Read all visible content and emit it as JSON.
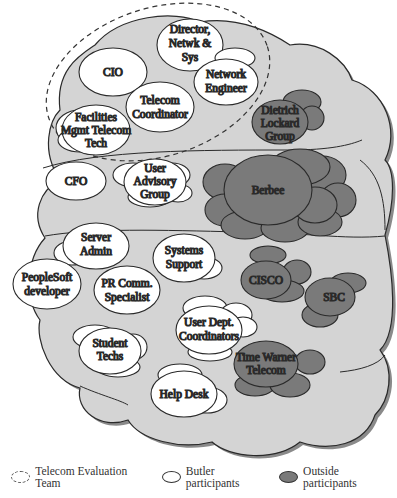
{
  "diagram": {
    "type": "network-cloud-diagram",
    "containers": {
      "top_cloud": "Light gray cloud region (upper)",
      "main_cloud": "Light gray cloud region (lower, larger)",
      "team_boundary": "Telecom Evaluation Team (dashed ellipse)"
    },
    "telecom_evaluation_team": [
      "Director, Netwk & Sys",
      "CIO",
      "Network Engineer",
      "Telecom Coordinator",
      "Facilities Mgmt Telecom Tech"
    ],
    "butler_participants": {
      "director": [
        "Director,",
        "Netwk &",
        "Sys"
      ],
      "cio": [
        "CIO"
      ],
      "network_engineer": [
        "Network",
        "Engineer"
      ],
      "telecom_coordinator": [
        "Telecom",
        "Coordinator"
      ],
      "facilities": [
        "Facilities",
        "Mgmt Telecom",
        "Tech"
      ],
      "cfo": [
        "CFO"
      ],
      "user_advisory": [
        "User",
        "Advisory",
        "Group"
      ],
      "server_admin": [
        "Server",
        "Admin"
      ],
      "systems_support": [
        "Systems",
        "Support"
      ],
      "peoplesoft": [
        "PeopleSoft",
        "developer"
      ],
      "pr_comm": [
        "PR Comm.",
        "Specialist"
      ],
      "user_dept": [
        "User Dept.",
        "Coordinators"
      ],
      "student_techs": [
        "Student",
        "Techs"
      ],
      "help_desk": [
        "Help Desk"
      ]
    },
    "outside_participants": {
      "dietrich": [
        "Dietrich",
        "Lockard",
        "Group"
      ],
      "berbee": [
        "Berbee"
      ],
      "cisco": [
        "CISCO"
      ],
      "sbc": [
        "SBC"
      ],
      "time_warner": [
        "Time Warner",
        "Telecom"
      ]
    },
    "colors": {
      "cloud_fill": "#d4d4d4",
      "cloud_shadow": "#8a8a8a",
      "butler_fill": "#ffffff",
      "outside_fill": "#7a7a7a",
      "stroke": "#2a2a2a"
    }
  },
  "legend": {
    "team": "Telecom Evaluation Team",
    "butler": "Butler participants",
    "outside": "Outside participants"
  }
}
